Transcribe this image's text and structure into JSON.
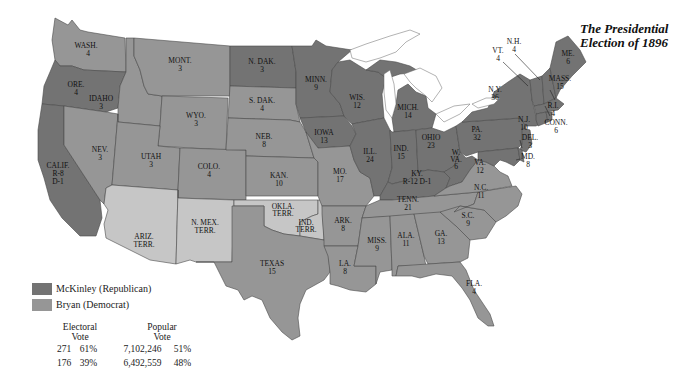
{
  "title": {
    "line1": "The Presidential",
    "line2": "Election of 1896"
  },
  "colors": {
    "republican": "#737373",
    "democrat": "#969696",
    "territory": "#c6c6c6",
    "water": "#ffffff",
    "border": "#4a4a4a"
  },
  "legend": {
    "items": [
      {
        "label": "McKinley (Republican)",
        "color": "#737373"
      },
      {
        "label": "Bryan (Democrat)",
        "color": "#969696"
      }
    ]
  },
  "results": {
    "electoral_header_1": "Electoral",
    "electoral_header_2": "Vote",
    "popular_header_1": "Popular",
    "popular_header_2": "Vote",
    "rows": [
      {
        "candidate": "McKinley",
        "electoral": "271",
        "electoral_pct": "61%",
        "popular": "7,102,246",
        "popular_pct": "51%"
      },
      {
        "candidate": "Bryan",
        "electoral": "176",
        "electoral_pct": "39%",
        "popular": "6,492,559",
        "popular_pct": "48%"
      }
    ]
  },
  "states": [
    {
      "abbr": "WASH.",
      "votes": "4",
      "party": "D"
    },
    {
      "abbr": "ORE.",
      "votes": "4",
      "party": "R"
    },
    {
      "abbr": "CALIF.",
      "votes": "R-8 D-1",
      "party": "R"
    },
    {
      "abbr": "IDAHO",
      "votes": "3",
      "party": "D"
    },
    {
      "abbr": "NEV.",
      "votes": "3",
      "party": "D"
    },
    {
      "abbr": "MONT.",
      "votes": "3",
      "party": "D"
    },
    {
      "abbr": "WYO.",
      "votes": "3",
      "party": "D"
    },
    {
      "abbr": "UTAH",
      "votes": "3",
      "party": "D"
    },
    {
      "abbr": "COLO.",
      "votes": "4",
      "party": "D"
    },
    {
      "abbr": "ARIZ. TERR.",
      "votes": "",
      "party": "T"
    },
    {
      "abbr": "N. MEX. TERR.",
      "votes": "",
      "party": "T"
    },
    {
      "abbr": "N. DAK.",
      "votes": "3",
      "party": "R"
    },
    {
      "abbr": "S. DAK.",
      "votes": "4",
      "party": "D"
    },
    {
      "abbr": "NEB.",
      "votes": "8",
      "party": "D"
    },
    {
      "abbr": "KAN.",
      "votes": "10",
      "party": "D"
    },
    {
      "abbr": "OKLA. TERR.",
      "votes": "",
      "party": "T"
    },
    {
      "abbr": "IND. TERR.",
      "votes": "",
      "party": "T"
    },
    {
      "abbr": "TEXAS",
      "votes": "15",
      "party": "D"
    },
    {
      "abbr": "MINN.",
      "votes": "9",
      "party": "R"
    },
    {
      "abbr": "IOWA",
      "votes": "13",
      "party": "R"
    },
    {
      "abbr": "MO.",
      "votes": "17",
      "party": "D"
    },
    {
      "abbr": "ARK.",
      "votes": "8",
      "party": "D"
    },
    {
      "abbr": "LA.",
      "votes": "8",
      "party": "D"
    },
    {
      "abbr": "WIS.",
      "votes": "12",
      "party": "R"
    },
    {
      "abbr": "ILL.",
      "votes": "24",
      "party": "R"
    },
    {
      "abbr": "MICH.",
      "votes": "14",
      "party": "R"
    },
    {
      "abbr": "IND.",
      "votes": "15",
      "party": "R"
    },
    {
      "abbr": "OHIO",
      "votes": "23",
      "party": "R"
    },
    {
      "abbr": "KY.",
      "votes": "R-12 D-1",
      "party": "R"
    },
    {
      "abbr": "TENN.",
      "votes": "21",
      "party": "D"
    },
    {
      "abbr": "MISS.",
      "votes": "9",
      "party": "D"
    },
    {
      "abbr": "ALA.",
      "votes": "11",
      "party": "D"
    },
    {
      "abbr": "GA.",
      "votes": "13",
      "party": "D"
    },
    {
      "abbr": "FLA.",
      "votes": "4",
      "party": "D"
    },
    {
      "abbr": "S.C.",
      "votes": "9",
      "party": "D"
    },
    {
      "abbr": "N.C.",
      "votes": "11",
      "party": "D"
    },
    {
      "abbr": "VA.",
      "votes": "12",
      "party": "D"
    },
    {
      "abbr": "W. VA.",
      "votes": "6",
      "party": "R"
    },
    {
      "abbr": "PA.",
      "votes": "32",
      "party": "R"
    },
    {
      "abbr": "N.Y.",
      "votes": "36",
      "party": "R"
    },
    {
      "abbr": "N.J.",
      "votes": "10",
      "party": "R"
    },
    {
      "abbr": "DEL.",
      "votes": "3",
      "party": "R"
    },
    {
      "abbr": "MD.",
      "votes": "8",
      "party": "R"
    },
    {
      "abbr": "VT.",
      "votes": "4",
      "party": "R"
    },
    {
      "abbr": "N.H.",
      "votes": "4",
      "party": "R"
    },
    {
      "abbr": "ME.",
      "votes": "6",
      "party": "R"
    },
    {
      "abbr": "MASS.",
      "votes": "15",
      "party": "R"
    },
    {
      "abbr": "R.I.",
      "votes": "4",
      "party": "R"
    },
    {
      "abbr": "CONN.",
      "votes": "6",
      "party": "R"
    }
  ]
}
